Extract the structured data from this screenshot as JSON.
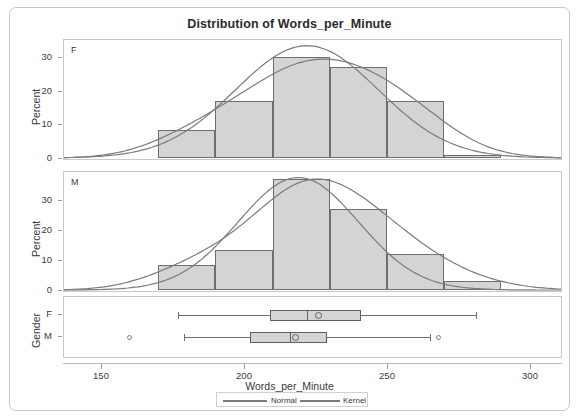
{
  "title": "Distribution of Words_per_Minute",
  "axis": {
    "xlabel": "Words_per_Minute",
    "ylabel": "Percent",
    "group_label": "Gender",
    "xticks": [
      "150",
      "200",
      "250",
      "300"
    ],
    "yticks_f": [
      "0",
      "10",
      "20",
      "30"
    ],
    "yticks_m": [
      "0",
      "10",
      "20",
      "30"
    ],
    "group_ticks": [
      "F",
      "M"
    ]
  },
  "panels": {
    "f_letter": "F",
    "m_letter": "M"
  },
  "legend": {
    "items": [
      {
        "label": "Normal",
        "color": "#7b7b7b"
      },
      {
        "label": "Kernel",
        "color": "#7b7b7b"
      }
    ]
  },
  "chart_data": {
    "type": "histogram",
    "title": "Distribution of Words_per_Minute",
    "xlabel": "Words_per_Minute",
    "ylabel": "Percent",
    "xlim": [
      133,
      315
    ],
    "xticks": [
      150,
      200,
      250,
      300
    ],
    "grid": false,
    "legend_position": "bottom",
    "panels": [
      {
        "group": "F",
        "ylim": [
          0,
          34
        ],
        "yticks": [
          0,
          10,
          20,
          30
        ],
        "bin_edges": [
          170,
          190,
          210,
          230,
          250,
          270,
          290
        ],
        "bin_percents": [
          8.5,
          17.0,
          30.0,
          27.0,
          17.0,
          1.0
        ],
        "curves": [
          {
            "name": "Normal",
            "mean": 222,
            "sd": 25,
            "peak_percent": 33.5
          },
          {
            "name": "Kernel",
            "mean": 222,
            "peak_percent": 29.5
          }
        ]
      },
      {
        "group": "M",
        "ylim": [
          0,
          38
        ],
        "yticks": [
          0,
          10,
          20,
          30
        ],
        "bin_edges": [
          170,
          190,
          210,
          230,
          250,
          270,
          290
        ],
        "bin_percents": [
          8.5,
          13.5,
          37.0,
          27.0,
          12.0,
          3.0
        ],
        "curves": [
          {
            "name": "Normal",
            "mean": 219,
            "sd": 21,
            "peak_percent": 37.5
          },
          {
            "name": "Kernel",
            "mean": 219,
            "peak_percent": 37.0
          }
        ]
      }
    ],
    "boxplots": [
      {
        "group": "F",
        "whisker_low": 177,
        "q1": 209,
        "median": 222,
        "mean": 226,
        "q3": 241,
        "whisker_high": 281,
        "outliers": []
      },
      {
        "group": "M",
        "whisker_low": 179,
        "q1": 202,
        "median": 216,
        "mean": 218,
        "q3": 229,
        "whisker_high": 265,
        "outliers": [
          160,
          268
        ]
      }
    ]
  }
}
